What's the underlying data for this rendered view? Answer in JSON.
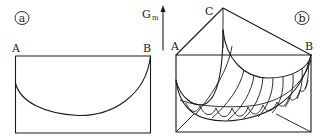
{
  "panel_a": {
    "tag": "a",
    "label_left": "A",
    "label_right": "B"
  },
  "panel_b": {
    "tag": "b",
    "label_left": "A",
    "label_apex": "C",
    "label_right": "B",
    "axis_label": "G",
    "axis_label_sub": "m"
  },
  "colors": {
    "stroke": "#1a1a1a",
    "background": "#ffffff"
  }
}
